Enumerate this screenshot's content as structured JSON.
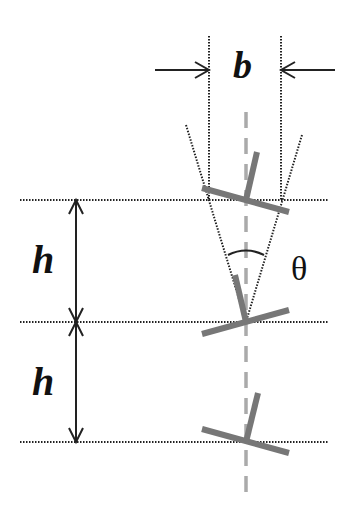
{
  "labels": {
    "width": "b",
    "height_top": "h",
    "height_bottom": "h",
    "angle": "θ"
  },
  "colors": {
    "line": "#222222",
    "leg": "#777777",
    "axis": "#aaaaaa",
    "background": "#ffffff"
  },
  "geometry": {
    "level_y": [
      200,
      322,
      442
    ],
    "axis_x": 246,
    "b_left_x": 209,
    "b_right_x": 281,
    "h_arrow_x": 76
  }
}
